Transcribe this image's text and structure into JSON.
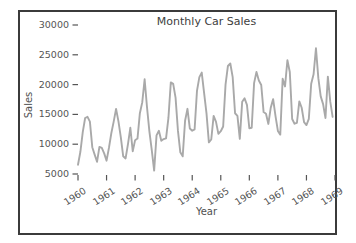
{
  "figure": {
    "title": "Monthly Car Sales",
    "xlabel": "Year",
    "ylabel": "Sales"
  },
  "chart_data": {
    "type": "line",
    "title": "Monthly Car Sales",
    "xlabel": "Year",
    "ylabel": "Sales",
    "x_tick_labels": [
      "1960",
      "1961",
      "1962",
      "1963",
      "1964",
      "1965",
      "1966",
      "1967",
      "1968",
      "1969"
    ],
    "y_ticks": [
      5000,
      10000,
      15000,
      20000,
      25000,
      30000
    ],
    "y_tick_labels": [
      "5000",
      "10000",
      "15000",
      "20000",
      "25000",
      "30000"
    ],
    "xlim": [
      1960,
      1969
    ],
    "ylim": [
      5000,
      30000
    ],
    "grid": false,
    "legend": null,
    "x_start_year": 1960,
    "points_per_year": 12,
    "series": [
      {
        "name": "Sales",
        "values": [
          6550,
          8728,
          12026,
          14395,
          14587,
          13791,
          9498,
          8251,
          7049,
          9545,
          9364,
          8456,
          7237,
          9374,
          11837,
          13784,
          15926,
          13821,
          11143,
          7975,
          7610,
          10015,
          12759,
          8816,
          10677,
          10947,
          15200,
          17010,
          20900,
          16205,
          12143,
          8997,
          5568,
          11474,
          12256,
          10583,
          10862,
          10965,
          14405,
          20379,
          20128,
          17816,
          12268,
          8642,
          7962,
          13932,
          15936,
          12628,
          12267,
          12470,
          18944,
          21259,
          22015,
          18581,
          15175,
          10306,
          10792,
          14752,
          13754,
          11738,
          12181,
          12965,
          19990,
          23125,
          23541,
          21247,
          15189,
          14767,
          10895,
          17130,
          17697,
          16611,
          12674,
          12760,
          20249,
          22135,
          20677,
          19933,
          15388,
          15113,
          13401,
          16135,
          17562,
          14720,
          12225,
          11608,
          20985,
          19692,
          24081,
          22114,
          14220,
          13434,
          13598,
          17187,
          16119,
          13713,
          13210,
          14251,
          20139,
          21725,
          26099,
          21084,
          18024,
          16722,
          14385,
          21342,
          17180,
          14577
        ]
      }
    ]
  },
  "colors": {
    "line": "#a9a9a9",
    "tick": "#555555",
    "text": "#555555",
    "title_text": "#404040",
    "border": "#3b3b3b",
    "background": "#ffffff"
  }
}
